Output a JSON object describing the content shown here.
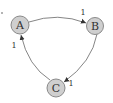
{
  "diagram": {
    "type": "directed-graph",
    "nodes": [
      {
        "id": "A",
        "label": "A"
      },
      {
        "id": "B",
        "label": "B"
      },
      {
        "id": "C",
        "label": "C"
      }
    ],
    "edges": [
      {
        "from": "A",
        "to": "B",
        "label": "1"
      },
      {
        "from": "B",
        "to": "C",
        "label": "1"
      },
      {
        "from": "C",
        "to": "A",
        "label": "1"
      }
    ],
    "colors": {
      "node_fill": "#cfcfcf",
      "node_stroke": "#8a8a8a",
      "edge": "#666666",
      "text": "#333333"
    }
  }
}
